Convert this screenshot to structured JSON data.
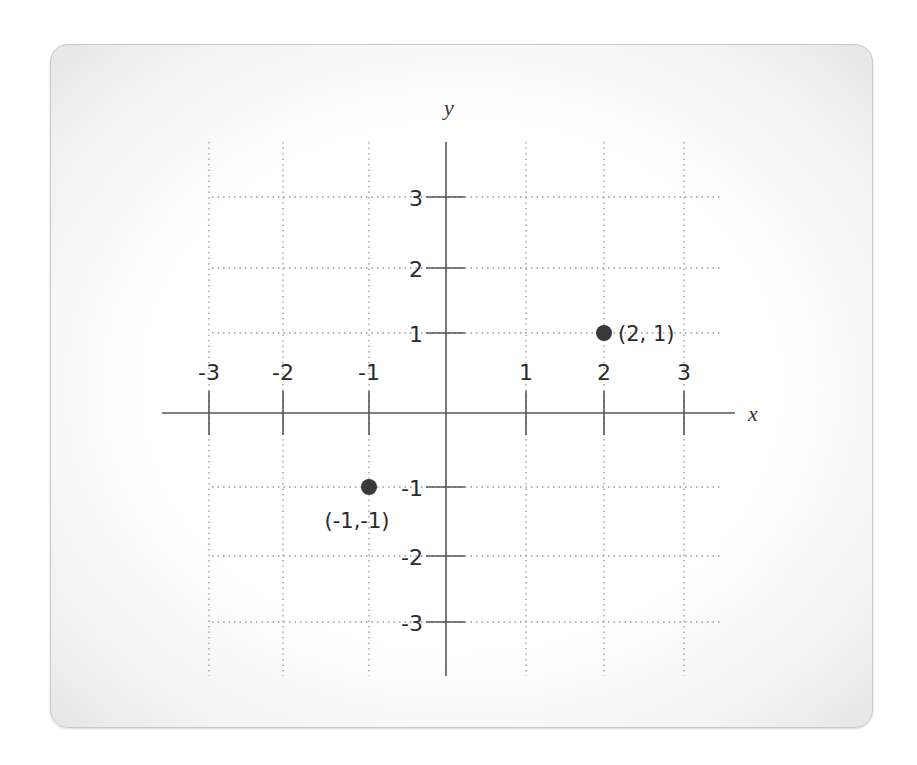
{
  "chart_data": {
    "type": "scatter",
    "title": "",
    "xlabel": "x",
    "ylabel": "y",
    "xlim": [
      -3.5,
      3.6
    ],
    "ylim": [
      -3.6,
      3.8
    ],
    "grid": true,
    "grid_style": "dotted",
    "x_ticks": [
      -3,
      -2,
      -1,
      1,
      2,
      3
    ],
    "y_ticks": [
      3,
      2,
      1,
      -1,
      -2,
      -3
    ],
    "x_tick_labels": [
      "-3",
      "-2",
      "-1",
      "1",
      "2",
      "3"
    ],
    "y_tick_labels": [
      "3",
      "2",
      "1",
      "-1",
      "-2",
      "-3"
    ],
    "points": [
      {
        "x": 2,
        "y": 1,
        "label": "(2, 1)"
      },
      {
        "x": -1,
        "y": -1,
        "label": "(-1,-1)"
      }
    ],
    "colors": {
      "point": "#3a3a3a",
      "axis": "#555555",
      "grid": "#9a9a9a"
    }
  }
}
